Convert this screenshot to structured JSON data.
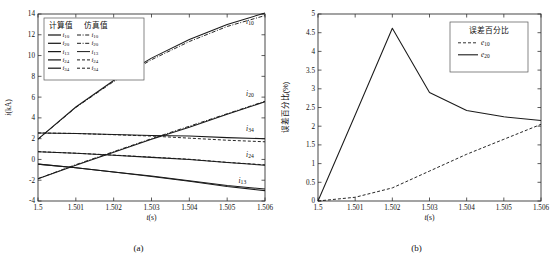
{
  "figure": {
    "panels": [
      {
        "id": "a",
        "caption": "(a)"
      },
      {
        "id": "b",
        "caption": "(b)"
      }
    ]
  },
  "chart_data": [
    {
      "type": "line",
      "panel": "(a)",
      "title": "",
      "xlabel": "t(s)",
      "ylabel": "i(kA)",
      "xlim": [
        1.5,
        1.506
      ],
      "ylim": [
        -4,
        14
      ],
      "xticks": [
        "1.5",
        "1.501",
        "1.502",
        "1.503",
        "1.504",
        "1.505",
        "1.506"
      ],
      "xtick_values": [
        1.5,
        1.501,
        1.502,
        1.503,
        1.504,
        1.505,
        1.506
      ],
      "yticks": [
        "-4",
        "-2",
        "0",
        "2",
        "4",
        "6",
        "8",
        "10",
        "12",
        "14"
      ],
      "ytick_values": [
        -4,
        -2,
        0,
        2,
        4,
        6,
        8,
        10,
        12,
        14
      ],
      "grid": false,
      "legend_position": "upper-left",
      "legend": {
        "col1_header": "计算值",
        "col2_header": "仿真值",
        "rows": [
          {
            "label": "i10",
            "calc_style": "solid",
            "sim_style": "dashdot"
          },
          {
            "label": "i20",
            "calc_style": "solid",
            "sim_style": "dashdot"
          },
          {
            "label": "i13",
            "calc_style": "solid",
            "sim_style": "solid"
          },
          {
            "label": "i24",
            "calc_style": "solid",
            "sim_style": "dashed"
          },
          {
            "label": "i34",
            "calc_style": "solid",
            "sim_style": "dashed"
          }
        ]
      },
      "x": [
        1.5,
        1.501,
        1.502,
        1.503,
        1.504,
        1.505,
        1.506
      ],
      "series": [
        {
          "name": "i10_calc",
          "label": "i10",
          "style": "solid",
          "values": [
            1.95,
            5.05,
            7.6,
            9.75,
            11.55,
            13.0,
            14.1
          ]
        },
        {
          "name": "i10_sim",
          "label": "i10",
          "style": "dashdot",
          "values": [
            1.95,
            5.0,
            7.5,
            9.6,
            11.35,
            12.8,
            13.85
          ]
        },
        {
          "name": "i20_calc",
          "label": "i20",
          "style": "solid",
          "values": [
            -1.85,
            -0.55,
            0.7,
            1.95,
            3.1,
            4.35,
            5.55
          ]
        },
        {
          "name": "i20_sim",
          "label": "i20",
          "style": "dashdot",
          "values": [
            -1.85,
            -0.5,
            0.75,
            2.0,
            3.2,
            4.4,
            5.6
          ]
        },
        {
          "name": "i13_calc",
          "label": "i13",
          "style": "solid",
          "values": [
            -0.45,
            -0.8,
            -1.2,
            -1.65,
            -2.1,
            -2.6,
            -3.0
          ]
        },
        {
          "name": "i13_sim",
          "label": "i13",
          "style": "solid",
          "values": [
            -0.45,
            -0.8,
            -1.2,
            -1.6,
            -2.05,
            -2.5,
            -2.85
          ]
        },
        {
          "name": "i24_calc",
          "label": "i24",
          "style": "solid",
          "values": [
            0.75,
            0.6,
            0.4,
            0.2,
            0.0,
            -0.3,
            -0.55
          ]
        },
        {
          "name": "i24_sim",
          "label": "i24",
          "style": "dashed",
          "values": [
            0.75,
            0.6,
            0.42,
            0.22,
            0.02,
            -0.28,
            -0.52
          ]
        },
        {
          "name": "i34_calc",
          "label": "i34",
          "style": "solid",
          "values": [
            2.55,
            2.5,
            2.4,
            2.3,
            2.25,
            2.1,
            2.0
          ]
        },
        {
          "name": "i34_sim",
          "label": "i34",
          "style": "dashed",
          "values": [
            2.55,
            2.5,
            2.38,
            2.25,
            2.05,
            1.85,
            1.7
          ]
        }
      ],
      "curve_annotations": [
        {
          "label": "i10",
          "x": 1.5055,
          "y": 13.0
        },
        {
          "label": "i20",
          "x": 1.5055,
          "y": 6.1
        },
        {
          "label": "i34",
          "x": 1.5055,
          "y": 2.75
        },
        {
          "label": "i24",
          "x": 1.5055,
          "y": 0.2
        },
        {
          "label": "i13",
          "x": 1.5053,
          "y": -2.3
        }
      ]
    },
    {
      "type": "line",
      "panel": "(b)",
      "title": "",
      "xlabel": "t(s)",
      "ylabel": "误差百分比(%)",
      "xlim": [
        1.5,
        1.506
      ],
      "ylim": [
        0,
        5
      ],
      "xticks": [
        "1.5",
        "1.501",
        "1.502",
        "1.503",
        "1.504",
        "1.505",
        "1.506"
      ],
      "xtick_values": [
        1.5,
        1.501,
        1.502,
        1.503,
        1.504,
        1.505,
        1.506
      ],
      "yticks": [
        "0",
        "0.5",
        "1",
        "1.5",
        "2",
        "2.5",
        "3",
        "3.5",
        "4",
        "4.5",
        "5"
      ],
      "ytick_values": [
        0,
        0.5,
        1,
        1.5,
        2,
        2.5,
        3,
        3.5,
        4,
        4.5,
        5
      ],
      "grid": false,
      "legend_position": "upper-right",
      "legend": {
        "title": "误差百分比",
        "rows": [
          {
            "label": "e10",
            "style": "dashed"
          },
          {
            "label": "e20",
            "style": "solid"
          }
        ]
      },
      "x": [
        1.5,
        1.501,
        1.502,
        1.503,
        1.504,
        1.505,
        1.506
      ],
      "series": [
        {
          "name": "e10",
          "label": "e10",
          "style": "dashed",
          "values": [
            0.0,
            0.1,
            0.35,
            0.8,
            1.25,
            1.65,
            2.05
          ]
        },
        {
          "name": "e20",
          "label": "e20",
          "style": "solid",
          "values": [
            0.0,
            2.3,
            4.62,
            2.9,
            2.42,
            2.25,
            2.15
          ]
        }
      ]
    }
  ]
}
